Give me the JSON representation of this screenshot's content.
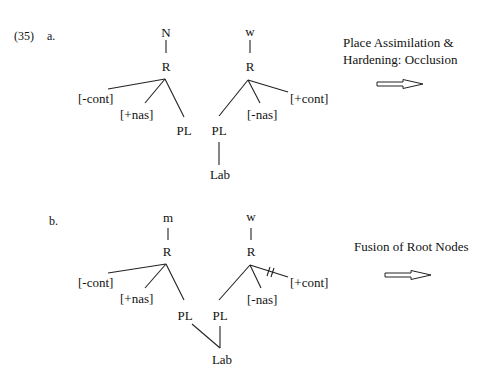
{
  "example_number": "(35)",
  "panels": [
    {
      "label": "a.",
      "segment1": {
        "top": "N",
        "root": "R",
        "features": [
          "[-cont]",
          "[+nas]"
        ],
        "place": "PL"
      },
      "segment2": {
        "top": "w",
        "root": "R",
        "place": "PL",
        "features": [
          "[-nas]",
          "[+cont]"
        ],
        "articulator": "Lab"
      },
      "process_line1": "Place Assimilation &",
      "process_line2": "Hardening: Occlusion",
      "arrow": "double-outline-right-arrow"
    },
    {
      "label": "b.",
      "segment1": {
        "top": "m",
        "root": "R",
        "features": [
          "[-cont]",
          "[+nas]"
        ],
        "place": "PL"
      },
      "segment2": {
        "top": "w",
        "root": "R",
        "place": "PL",
        "features": [
          "[-nas]",
          "[+cont]"
        ],
        "articulator": "Lab",
        "delinked": "[+cont]"
      },
      "process_line1": "Fusion of Root Nodes",
      "arrow": "double-outline-right-arrow"
    }
  ]
}
